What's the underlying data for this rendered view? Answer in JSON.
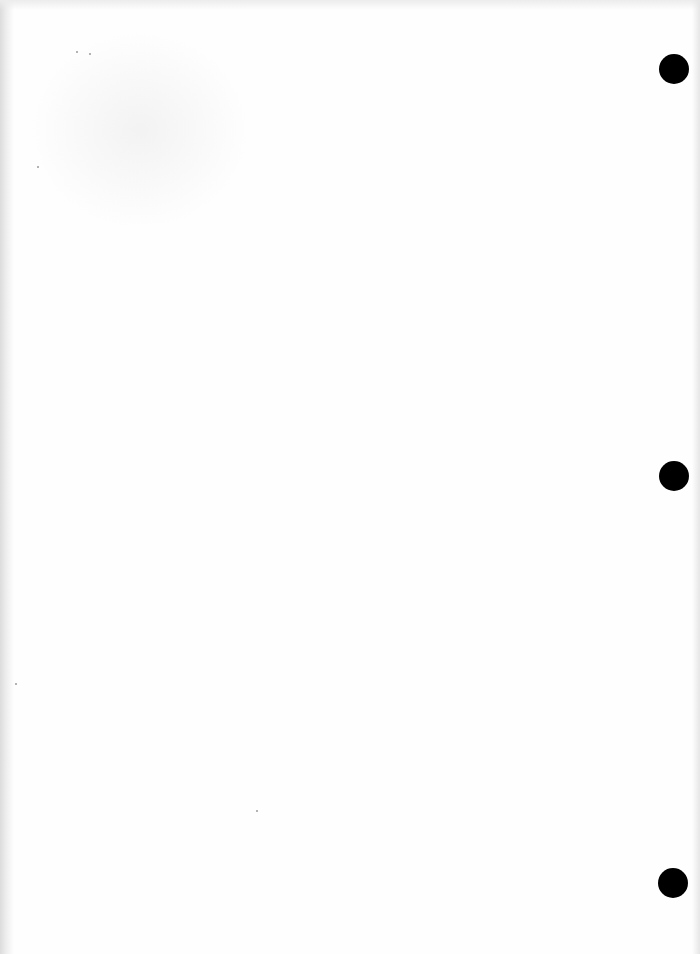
{
  "document": {
    "type": "blank scanned page",
    "text_content": "",
    "background_color": "#fefefe"
  },
  "punch_holes": [
    {
      "cx": 674,
      "cy": 69,
      "r": 15,
      "color": "#000000"
    },
    {
      "cx": 674,
      "cy": 476,
      "r": 15,
      "color": "#000000"
    },
    {
      "cx": 673,
      "cy": 883,
      "r": 15,
      "color": "#000000"
    }
  ],
  "specks": [
    {
      "x": 89,
      "y": 53
    },
    {
      "x": 76,
      "y": 51
    },
    {
      "x": 37,
      "y": 166
    },
    {
      "x": 15,
      "y": 683
    },
    {
      "x": 256,
      "y": 810
    }
  ]
}
